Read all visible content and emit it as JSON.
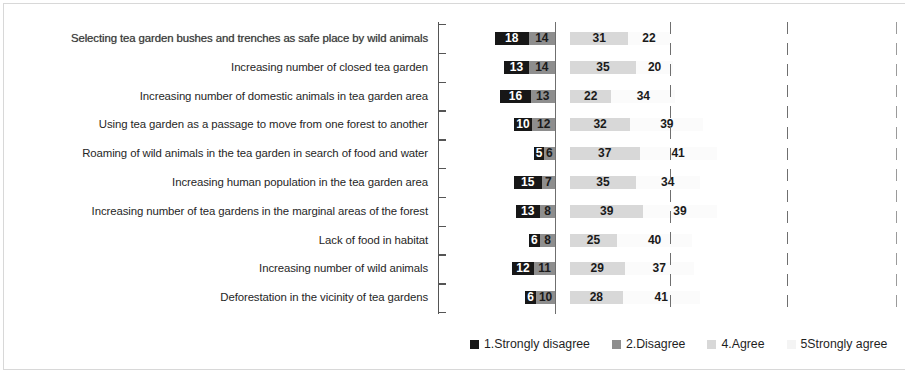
{
  "chart_data": {
    "type": "bar",
    "subtype": "diverging-stacked-bar",
    "title": "",
    "subtitle": "",
    "xlabel": "",
    "ylabel": "",
    "orientation": "horizontal",
    "grid": true,
    "gridlines_note": "one solid zero line plus three dashed vertical reference lines",
    "legend_position": "bottom",
    "axis_note": "percentages; disagree categories extend left of the zero line, agree categories extend right",
    "categories": [
      "Selecting tea garden bushes and trenches as safe place by wild animals",
      "Increasing number of closed tea garden",
      "Increasing number of domestic animals in tea garden area",
      "Using tea garden as a passage to move from one forest to another",
      "Roaming of wild animals in the tea garden in search of food and water",
      "Increasing human population in the tea garden area",
      "Increasing number of tea gardens in the marginal areas of the forest",
      "Lack of food in habitat",
      "Increasing number of wild animals",
      "Deforestation in the vicinity of tea gardens"
    ],
    "series": [
      {
        "name": "1.Strongly disagree",
        "color": "#171717",
        "side": "negative",
        "values": [
          18,
          13,
          16,
          10,
          5,
          15,
          13,
          6,
          12,
          6
        ]
      },
      {
        "name": "2.Disagree",
        "color": "#8e8e8e",
        "side": "negative",
        "values": [
          14,
          14,
          13,
          12,
          6,
          7,
          8,
          8,
          11,
          10
        ]
      },
      {
        "name": "4.Agree",
        "color": "#d8d8d8",
        "side": "positive",
        "values": [
          31,
          35,
          22,
          32,
          37,
          35,
          39,
          25,
          29,
          28
        ]
      },
      {
        "name": "5Strongly agree",
        "color": "#fbfbfb",
        "side": "positive",
        "values": [
          22,
          20,
          34,
          39,
          41,
          34,
          39,
          40,
          37,
          41
        ]
      }
    ]
  },
  "legend": {
    "items": [
      {
        "label": "1.Strongly disagree",
        "color": "#171717"
      },
      {
        "label": "2.Disagree",
        "color": "#8e8e8e"
      },
      {
        "label": "4.Agree",
        "color": "#d8d8d8"
      },
      {
        "label": "5Strongly agree",
        "color": "#f4f4f4"
      }
    ]
  }
}
